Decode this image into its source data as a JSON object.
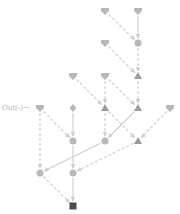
{
  "diagram": {
    "label": {
      "text": "Out(-)→",
      "x": 2,
      "y": 104
    },
    "colors": {
      "light_node": "#b8b8b8",
      "mid_node": "#9a9a9a",
      "dark_node": "#4a4a4a",
      "edge": "#cfcfcf"
    },
    "nodes": [
      {
        "id": "n0a",
        "shape": "heart",
        "x": 105,
        "y": 11,
        "tone": "light"
      },
      {
        "id": "n0b",
        "shape": "heart",
        "x": 138,
        "y": 11,
        "tone": "light"
      },
      {
        "id": "n1a",
        "shape": "heart",
        "x": 105,
        "y": 43,
        "tone": "light"
      },
      {
        "id": "n1b",
        "shape": "circle",
        "x": 138,
        "y": 43,
        "tone": "light"
      },
      {
        "id": "n2a",
        "shape": "heart",
        "x": 73,
        "y": 76,
        "tone": "light"
      },
      {
        "id": "n2b",
        "shape": "heart",
        "x": 105,
        "y": 76,
        "tone": "light"
      },
      {
        "id": "n2c",
        "shape": "triangle",
        "x": 138,
        "y": 76,
        "tone": "mid"
      },
      {
        "id": "n3a",
        "shape": "heart",
        "x": 40,
        "y": 108,
        "tone": "light"
      },
      {
        "id": "n3b",
        "shape": "diamond",
        "x": 73,
        "y": 108,
        "tone": "light"
      },
      {
        "id": "n3c",
        "shape": "triangle",
        "x": 105,
        "y": 108,
        "tone": "mid"
      },
      {
        "id": "n3d",
        "shape": "triangle",
        "x": 138,
        "y": 108,
        "tone": "mid"
      },
      {
        "id": "n3e",
        "shape": "heart",
        "x": 170,
        "y": 108,
        "tone": "light"
      },
      {
        "id": "n4a",
        "shape": "circle",
        "x": 73,
        "y": 141,
        "tone": "light"
      },
      {
        "id": "n4b",
        "shape": "circle",
        "x": 105,
        "y": 141,
        "tone": "light"
      },
      {
        "id": "n4c",
        "shape": "triangle",
        "x": 138,
        "y": 141,
        "tone": "mid"
      },
      {
        "id": "n5a",
        "shape": "circle",
        "x": 40,
        "y": 173,
        "tone": "light"
      },
      {
        "id": "n5b",
        "shape": "circle",
        "x": 73,
        "y": 173,
        "tone": "light"
      },
      {
        "id": "n6a",
        "shape": "square",
        "x": 73,
        "y": 206,
        "tone": "dark"
      }
    ],
    "edges": [
      {
        "from": "n0a",
        "to": "n1b",
        "style": "dashed"
      },
      {
        "from": "n0b",
        "to": "n1b",
        "style": "solid"
      },
      {
        "from": "n1a",
        "to": "n2c",
        "style": "dashed"
      },
      {
        "from": "n1b",
        "to": "n2c",
        "style": "dashed"
      },
      {
        "from": "n2a",
        "to": "n3c",
        "style": "dashed"
      },
      {
        "from": "n2b",
        "to": "n3c",
        "style": "dashed"
      },
      {
        "from": "n2b",
        "to": "n3d",
        "style": "dashed"
      },
      {
        "from": "n2c",
        "to": "n3d",
        "style": "dashed"
      },
      {
        "from": "n3a",
        "to": "n4a",
        "style": "dashed"
      },
      {
        "from": "n3a",
        "to": "n5a",
        "style": "dashed"
      },
      {
        "from": "n3b",
        "to": "n4a",
        "style": "solid"
      },
      {
        "from": "n3c",
        "to": "n4b",
        "style": "dashed"
      },
      {
        "from": "n3c",
        "to": "n4c",
        "style": "dashed"
      },
      {
        "from": "n3d",
        "to": "n4b",
        "style": "solid"
      },
      {
        "from": "n3e",
        "to": "n4c",
        "style": "dashed"
      },
      {
        "from": "n4a",
        "to": "n5b",
        "style": "solid"
      },
      {
        "from": "n4b",
        "to": "n5a",
        "style": "solid"
      },
      {
        "from": "n4c",
        "to": "n5b",
        "style": "dashed"
      },
      {
        "from": "n5a",
        "to": "n6a",
        "style": "dashed"
      },
      {
        "from": "n5b",
        "to": "n6a",
        "style": "solid"
      }
    ]
  }
}
